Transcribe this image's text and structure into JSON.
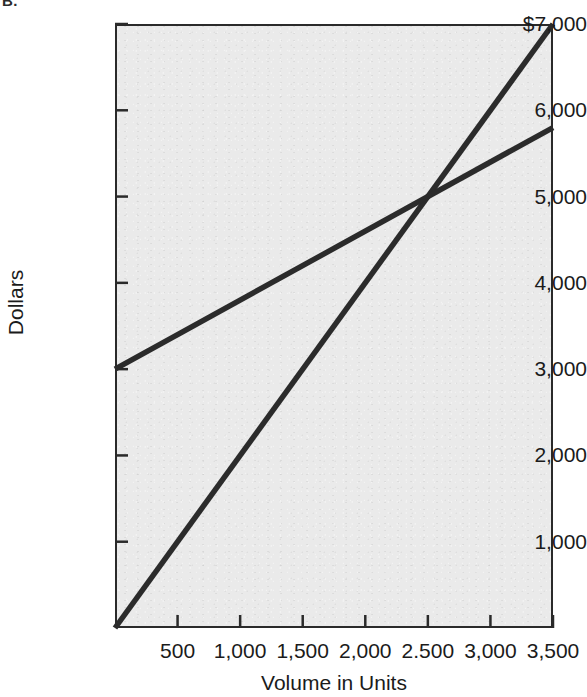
{
  "figure": {
    "label": "B."
  },
  "chart_data": {
    "type": "line",
    "title": "",
    "xlabel": "Volume in Units",
    "ylabel": "Dollars",
    "xlim": [
      0,
      3500
    ],
    "ylim": [
      0,
      7000
    ],
    "grid": false,
    "legend": null,
    "xticks": [
      500,
      1000,
      1500,
      2000,
      2500,
      3000,
      3500
    ],
    "xtick_labels": [
      "500",
      "1,000",
      "1,500",
      "2,000",
      "2.500",
      "3,000",
      "3,500"
    ],
    "yticks": [
      1000,
      2000,
      3000,
      4000,
      5000,
      6000,
      7000
    ],
    "ytick_labels": [
      "1,000",
      "2,000",
      "3,000",
      "4,000",
      "5,000",
      "6,000",
      "$7,000"
    ],
    "series": [
      {
        "name": "total-revenue",
        "x": [
          0,
          3500
        ],
        "values": [
          0,
          7000
        ],
        "color": "#2b2b2b"
      },
      {
        "name": "total-cost",
        "x": [
          0,
          3500
        ],
        "values": [
          3000,
          5800
        ],
        "color": "#2b2b2b"
      }
    ],
    "annotations": [
      {
        "name": "break-even-point",
        "x": 2500,
        "y": 5000
      }
    ],
    "colors": {
      "plot_background": "#eaeaea",
      "axis": "#2a2a2a",
      "line": "#2b2b2b",
      "text": "#1b1b1b",
      "page_background": "#ffffff"
    }
  }
}
